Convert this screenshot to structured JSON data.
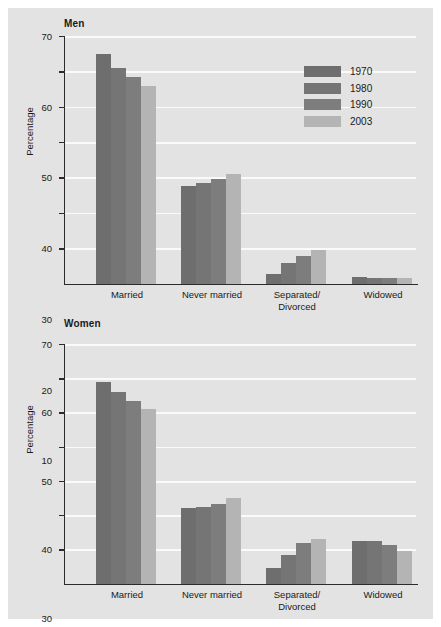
{
  "figure": {
    "background_color": "#e3e3e3",
    "axis_color": "#2b2b2b",
    "gridline_color": "#fafafa"
  },
  "legend": {
    "position": "top-right",
    "entries": [
      {
        "label": "1970",
        "color": "#6e6e6e"
      },
      {
        "label": "1980",
        "color": "#757575"
      },
      {
        "label": "1990",
        "color": "#7d7d7d"
      },
      {
        "label": "2003",
        "color": "#b4b4b4"
      }
    ]
  },
  "chart_data": [
    {
      "type": "bar",
      "title": "Men",
      "xlabel": "",
      "ylabel": "Percentage",
      "ylim": [
        0,
        70
      ],
      "yticks": [
        10,
        20,
        30,
        40,
        50,
        60,
        70
      ],
      "grid": true,
      "categories": [
        "Married",
        "Never married",
        "Separated/\nDivorced",
        "Widowed"
      ],
      "series": [
        {
          "name": "1970",
          "color": "#6e6e6e",
          "values": [
            65,
            27.7,
            2.8,
            2.0
          ]
        },
        {
          "name": "1980",
          "color": "#757575",
          "values": [
            61,
            28.5,
            5.8,
            1.5
          ]
        },
        {
          "name": "1990",
          "color": "#7d7d7d",
          "values": [
            58.5,
            29.5,
            7.8,
            1.5
          ]
        },
        {
          "name": "2003",
          "color": "#b4b4b4",
          "values": [
            56,
            31,
            9.4,
            1.5
          ]
        }
      ]
    },
    {
      "type": "bar",
      "title": "Women",
      "xlabel": "",
      "ylabel": "Percentage",
      "ylim": [
        0,
        70
      ],
      "yticks": [
        10,
        20,
        30,
        40,
        50,
        60,
        70
      ],
      "grid": true,
      "categories": [
        "Married",
        "Never married",
        "Separated/\nDivorced",
        "Widowed"
      ],
      "series": [
        {
          "name": "1970",
          "color": "#6e6e6e",
          "values": [
            59,
            22.1,
            4.5,
            12.5
          ]
        },
        {
          "name": "1980",
          "color": "#757575",
          "values": [
            56,
            22.5,
            8.5,
            12.5
          ]
        },
        {
          "name": "1990",
          "color": "#7d7d7d",
          "values": [
            53.5,
            23.3,
            12.0,
            11.3
          ]
        },
        {
          "name": "2003",
          "color": "#b4b4b4",
          "values": [
            51,
            25,
            13.0,
            9.5
          ]
        }
      ]
    }
  ]
}
